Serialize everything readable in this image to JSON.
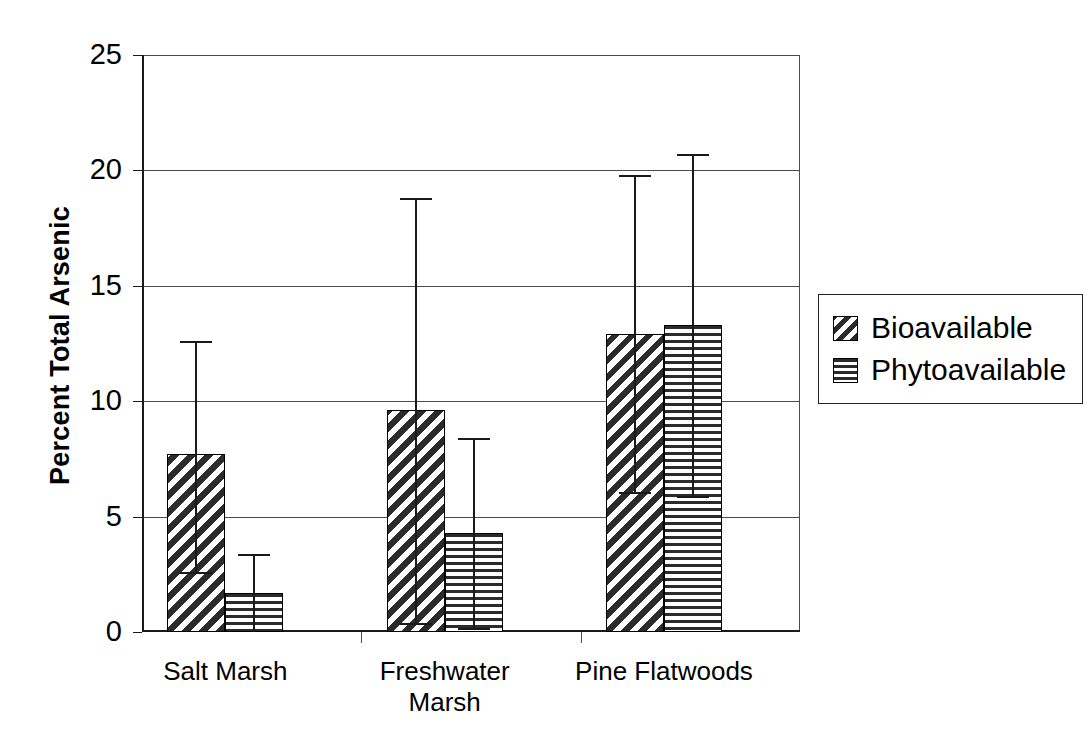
{
  "chart_data": {
    "type": "bar",
    "title": "",
    "xlabel": "",
    "ylabel": "Percent Total Arsenic",
    "ylim": [
      0,
      25
    ],
    "yticks": [
      0,
      5,
      10,
      15,
      20,
      25
    ],
    "ytick_labels": [
      "0",
      "5",
      "10",
      "15",
      "20",
      "25"
    ],
    "grid": true,
    "legend_position": "right",
    "categories": [
      "Salt Marsh",
      "Freshwater\nMarsh",
      "Pine Flatwoods"
    ],
    "series": [
      {
        "name": "Bioavailable",
        "pattern": "diagonal-hatch",
        "values": [
          7.7,
          9.6,
          12.9
        ],
        "error_upper": [
          12.6,
          18.8,
          19.8
        ],
        "error_lower": [
          2.5,
          0.3,
          6.0
        ]
      },
      {
        "name": "Phytoavailable",
        "pattern": "horizontal-hatch",
        "values": [
          1.7,
          4.3,
          13.3
        ],
        "error_upper": [
          3.4,
          8.4,
          20.7
        ],
        "error_lower": [
          0.0,
          0.1,
          5.8
        ]
      }
    ]
  },
  "axes": {
    "y_title": "Percent Total Arsenic"
  },
  "legend": {
    "entries": [
      {
        "label": "Bioavailable"
      },
      {
        "label": "Phytoavailable"
      }
    ]
  },
  "colors": {
    "ink": "#000000",
    "grid": "#4c4c4c",
    "hatch": "#2b2b2b",
    "background": "#ffffff"
  }
}
